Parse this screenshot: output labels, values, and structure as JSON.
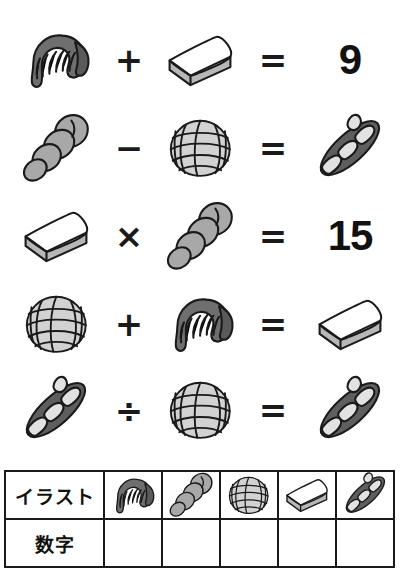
{
  "puzzle": {
    "kind": "bread-icon-math-puzzle",
    "equations": [
      {
        "left_icon": "croissant-icon",
        "operator": "+",
        "right_icon": "bread-slice-icon",
        "equals": "=",
        "result_kind": "number",
        "result_number": "9",
        "result_icon": ""
      },
      {
        "left_icon": "twist-bread-icon",
        "operator": "−",
        "right_icon": "melon-pan-icon",
        "equals": "=",
        "result_kind": "icon",
        "result_number": "",
        "result_icon": "baguette-icon"
      },
      {
        "left_icon": "bread-slice-icon",
        "operator": "×",
        "right_icon": "twist-bread-icon",
        "equals": "=",
        "result_kind": "number",
        "result_number": "15",
        "result_icon": ""
      },
      {
        "left_icon": "melon-pan-icon",
        "operator": "+",
        "right_icon": "croissant-icon",
        "equals": "=",
        "result_kind": "icon",
        "result_number": "",
        "result_icon": "bread-slice-icon"
      },
      {
        "left_icon": "baguette-icon",
        "operator": "÷",
        "right_icon": "melon-pan-icon",
        "equals": "=",
        "result_kind": "icon",
        "result_number": "",
        "result_icon": "baguette-icon"
      }
    ]
  },
  "answer_table": {
    "rows": [
      {
        "label": "イラスト",
        "cells": [
          "croissant-icon",
          "twist-bread-icon",
          "melon-pan-icon",
          "bread-slice-icon",
          "baguette-icon"
        ]
      },
      {
        "label": "数字",
        "cells": [
          "",
          "",
          "",
          "",
          ""
        ]
      }
    ]
  },
  "colors": {
    "background": "#ffffff",
    "outline": "#1a1a1a",
    "text": "#111111",
    "croissant_fill": "#6f6f6f",
    "croissant_tip": "#5a5a5a",
    "bread_slice_top": "#ffffff",
    "bread_slice_side": "#b7b7b7",
    "melon_pan_fill": "#d2d2d2",
    "twist_bread_fill": "#a8a8a8",
    "baguette_fill": "#5e5e5e",
    "baguette_slash": "#e2e2e2"
  }
}
